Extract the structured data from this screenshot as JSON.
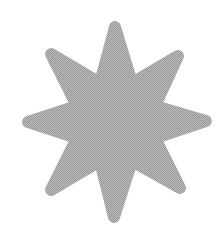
{
  "canvas": {
    "width": 224,
    "height": 235,
    "background_color": "#ffffff"
  },
  "graphic": {
    "name": "eight-point-starburst",
    "texture_light_color": "#bdbdbd",
    "texture_dark_color": "#979797",
    "average_gray": "#aaaaaa",
    "path_d": "M115 27L132 83L178 56L155 106L206 121L155 138L180 188L132 161L114 217L100 161L51 190L77 138L28 122L77 106L51 54L100 83Z"
  }
}
